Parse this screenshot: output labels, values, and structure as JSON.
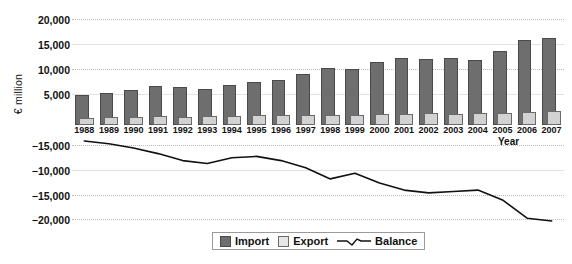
{
  "chart_data": {
    "type": "bar",
    "title": "",
    "xlabel": "Year",
    "ylabel": "€ million",
    "categories": [
      "1988",
      "1989",
      "1990",
      "1991",
      "1992",
      "1993",
      "1994",
      "1995",
      "1996",
      "1997",
      "1998",
      "1999",
      "2000",
      "2001",
      "2002",
      "2003",
      "2004",
      "2005",
      "2006",
      "2007"
    ],
    "series": [
      {
        "name": "Import",
        "type": "bar",
        "color": "#6e6e6e",
        "values": [
          6000,
          6500,
          7000,
          7800,
          7700,
          7200,
          8100,
          8600,
          9100,
          10200,
          11500,
          11200,
          12700,
          13400,
          13300,
          13400,
          13000,
          14800,
          17000,
          17400
        ]
      },
      {
        "name": "Export",
        "type": "bar",
        "color": "#d2d2d2",
        "values": [
          1500,
          1600,
          1700,
          1750,
          1700,
          1750,
          1900,
          1950,
          2000,
          2050,
          2100,
          2100,
          2150,
          2250,
          2450,
          2250,
          2500,
          2400,
          2550,
          2900
        ]
      },
      {
        "name": "Balance",
        "type": "line",
        "color": "#111111",
        "values": [
          -14300,
          -14500,
          -14800,
          -15200,
          -15700,
          -15900,
          -15500,
          -15400,
          -15700,
          -16200,
          -17000,
          -16600,
          -17300,
          -17800,
          -18000,
          -17900,
          -17800,
          -18500,
          -19800,
          -20000
        ]
      }
    ],
    "upper_panel": {
      "yticks": [
        "20,000",
        "15,000",
        "10,000",
        "5,000"
      ],
      "ytick_values": [
        20000,
        15000,
        10000,
        5000
      ],
      "ylim": [
        0,
        22000
      ],
      "grid": true
    },
    "lower_panel": {
      "yticks": [
        "−15,000",
        "−10,000",
        "−15,000",
        "−20,000"
      ],
      "ytick_values": [
        -15000,
        -10000,
        -15000,
        -20000
      ],
      "grid": true,
      "note": "axis labels as printed in source image"
    },
    "legend": {
      "position": "bottom-center",
      "entries": [
        {
          "label": "Import",
          "marker": "filled-square-dark"
        },
        {
          "label": "Export",
          "marker": "filled-square-light"
        },
        {
          "label": "Balance",
          "marker": "line"
        }
      ]
    }
  }
}
